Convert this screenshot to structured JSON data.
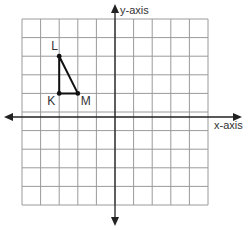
{
  "diagram": {
    "type": "coordinate-grid",
    "y_axis_label": "y-axis",
    "x_axis_label": "x-axis",
    "grid": {
      "columns": 10,
      "rows": 10,
      "x_range": [
        -5,
        5
      ],
      "y_range": [
        -5,
        5
      ]
    },
    "triangle": {
      "vertices": [
        {
          "name": "L",
          "x": -3,
          "y": 3
        },
        {
          "name": "K",
          "x": -3,
          "y": 1
        },
        {
          "name": "M",
          "x": -2,
          "y": 1
        }
      ]
    },
    "colors": {
      "grid": "#9a9a9a",
      "axis": "#222222",
      "triangle": "#111111"
    }
  }
}
